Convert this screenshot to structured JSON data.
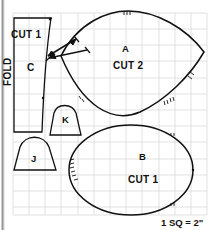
{
  "figure": {
    "kind": "sewing-pattern-grid-diagram",
    "caption": "1 SQ = 2\"",
    "colors": {
      "background": "#ffffff",
      "grid_line": "#d8d8d8",
      "ink": "#111111",
      "scan_edge": "#8d8d8d"
    },
    "grid": {
      "left": 13,
      "top": 13,
      "right": 207,
      "bottom": 215,
      "cell": 16.2,
      "visible": true
    }
  },
  "pieces": [
    {
      "id": "piece-c",
      "label": "C",
      "cut": "CUT 1",
      "fold": "FOLD",
      "shape": "tapered-rectangle"
    },
    {
      "id": "piece-a",
      "label": "A",
      "cut": "CUT 2",
      "shape": "pointed-oval"
    },
    {
      "id": "piece-b",
      "label": "B",
      "cut": "CUT 1",
      "shape": "ellipse"
    },
    {
      "id": "piece-j",
      "label": "J",
      "shape": "domed-trapezoid"
    },
    {
      "id": "piece-k",
      "label": "K",
      "shape": "domed-trapezoid"
    }
  ],
  "labels": {
    "piece_c_cut": "CUT 1",
    "piece_c_name": "C",
    "piece_c_fold": "FOLD",
    "piece_a_name": "A",
    "piece_a_cut": "CUT 2",
    "piece_b_name": "B",
    "piece_b_cut": "CUT 1",
    "piece_j_name": "J",
    "piece_k_name": "K",
    "scale_caption": "1 SQ = 2\""
  }
}
